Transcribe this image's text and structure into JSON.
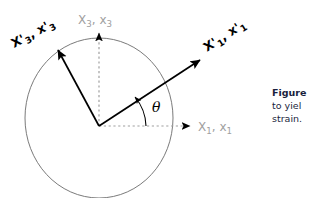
{
  "figure": {
    "type": "coordinate-rotation-diagram",
    "background_color": "#ffffff",
    "origin": {
      "x": 99,
      "y": 126
    },
    "ellipse": {
      "center_x": 99,
      "center_y": 118,
      "radius_x": 74,
      "radius_y": 80,
      "stroke_color": "#6b6b6b",
      "stroke_width": 0.9,
      "fill": "none"
    },
    "reference_axes": {
      "color": "#a0a0a0",
      "style": "dotted",
      "arrowhead_color": "#000000",
      "horizontal": {
        "label_x": "X",
        "label_x_sub": "1",
        "label_x_lower": "x",
        "label_x_lower_sub": "1",
        "label_full": "X1, x1",
        "from_x": 99,
        "from_y": 126,
        "to_x": 196,
        "to_y": 126
      },
      "vertical": {
        "label_x": "X",
        "label_x_sub": "3",
        "label_x_lower": "x",
        "label_x_lower_sub": "3",
        "label_full": "X3, x3",
        "from_x": 99,
        "from_y": 126,
        "to_x": 99,
        "to_y": 28
      }
    },
    "rotated_axes": {
      "color": "#000000",
      "style": "solid",
      "stroke_width": 1.6,
      "primary": {
        "label_x": "X",
        "label_prime": "'",
        "label_x_sub": "1",
        "label_x_lower": "x",
        "label_full": "X'1, x'1",
        "from_x": 99,
        "from_y": 126,
        "to_x": 205,
        "to_y": 56,
        "label_rotation_deg": -33
      },
      "secondary": {
        "label_x": "X",
        "label_prime": "'",
        "label_x_sub": "3",
        "label_x_lower": "x",
        "label_full": "X'3, x'3",
        "from_x": 99,
        "from_y": 126,
        "to_x": 54,
        "to_y": 44,
        "label_rotation_deg": -28
      }
    },
    "angle": {
      "symbol": "θ",
      "arc_color": "#000000",
      "arc_radius": 44,
      "label_x": 158,
      "label_y": 110
    }
  },
  "caption": {
    "lead": "Figure",
    "line2": "to yiel",
    "line3": "strain.",
    "color": "#1a1f3d",
    "clipped": true
  }
}
